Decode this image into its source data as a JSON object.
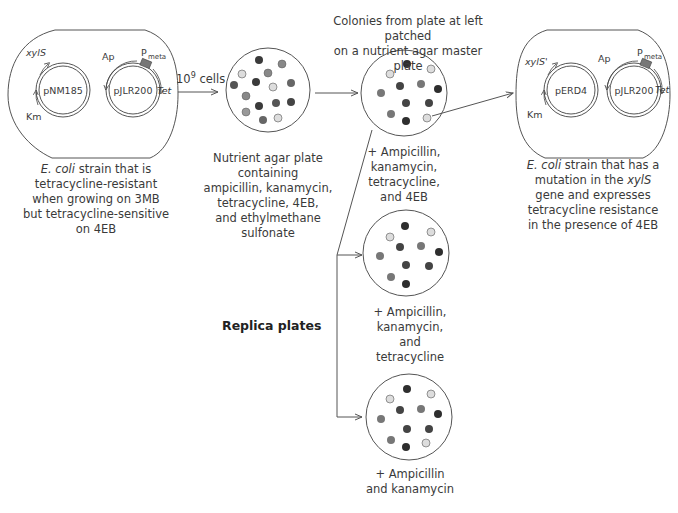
{
  "diagram": {
    "title": "",
    "left_cell": {
      "plasmid_a": {
        "name": "pNM185",
        "gene_top": "xylS",
        "gene_bottom": "Km"
      },
      "plasmid_b": {
        "name": "pJLR200",
        "gene_top": "Ap",
        "promoter": "P",
        "promoter_sub": "meta",
        "gene_right": "Tet"
      },
      "caption_italic": "E. coli",
      "caption_rest_1": " strain that is",
      "caption_2": "tetracycline-resistant",
      "caption_3": "when growing on 3MB",
      "caption_4": "but tetracycline-sensitive",
      "caption_5": "on 4EB"
    },
    "arrow_1": {
      "label": "10",
      "label_sup": "9",
      "label_suffix": " cells"
    },
    "plate_1": {
      "caption": [
        "Nutrient agar plate",
        "containing",
        "ampicillin, kanamycin,",
        "tetracycline, 4EB,",
        "and ethylmethane",
        "sulfonate"
      ]
    },
    "master_plate": {
      "heading_1": "Colonies from plate at left patched",
      "heading_2": "on a nutrient agar master plate",
      "caption": [
        "+ Ampicillin,",
        "kanamycin,",
        "tetracycline,",
        "and 4EB"
      ]
    },
    "replica_label": "Replica plates",
    "replica_1": {
      "caption": [
        "+ Ampicillin, kanamycin,",
        "and",
        "tetracycline"
      ]
    },
    "replica_2": {
      "caption": [
        "+ Ampicillin",
        "and kanamycin"
      ]
    },
    "right_cell": {
      "plasmid_a": {
        "name": "pERD4",
        "gene_top": "xylS'",
        "gene_bottom": "Km"
      },
      "plasmid_b": {
        "name": "pJLR200",
        "gene_top": "Ap",
        "promoter": "P",
        "promoter_sub": "meta",
        "gene_right": "Tet"
      },
      "caption_italic": "E. coli",
      "caption_rest_1": " strain that has a",
      "caption_2_pre": "mutation in the ",
      "caption_2_italic": "xylS",
      "caption_3": "gene and expresses",
      "caption_4": "tetracycline resistance",
      "caption_5": "in the presence of 4EB"
    },
    "colors": {
      "colony_dark": "#3a3a3a",
      "colony_mid": "#777777",
      "colony_light": "#d8d8d8",
      "promoter_box": "#777777",
      "line": "#555555"
    }
  }
}
